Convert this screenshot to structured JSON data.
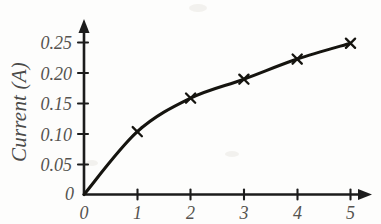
{
  "chart_data": {
    "type": "line",
    "title": "",
    "xlabel": "",
    "ylabel": "Current (A)",
    "x": [
      0,
      1,
      2,
      3,
      4,
      5
    ],
    "values": [
      0,
      0.103,
      0.158,
      0.189,
      0.222,
      0.248
    ],
    "series": [
      {
        "name": "Current",
        "values": [
          0,
          0.103,
          0.158,
          0.189,
          0.222,
          0.248
        ]
      }
    ],
    "xlim": [
      0,
      5.4
    ],
    "ylim": [
      0,
      0.27
    ],
    "xticks": [
      "0",
      "1",
      "2",
      "3",
      "4",
      "5"
    ],
    "yticks": [
      "0",
      "0.05",
      "0.10",
      "0.15",
      "0.20",
      "0.25"
    ],
    "ytick_values": [
      0,
      0.05,
      0.1,
      0.15,
      0.2,
      0.25
    ],
    "grid": false,
    "legend": false,
    "legend_position": "none",
    "marker": "x",
    "line_color": "#15140f",
    "axis_color": "#1c1c1c",
    "background_color": "#fdfdfc"
  },
  "axes": {
    "y_title": "Current (A)",
    "x_title": "",
    "origin_label": "0"
  },
  "ticks": {
    "y": [
      {
        "label": "0.25",
        "value": 0.25
      },
      {
        "label": "0.20",
        "value": 0.2
      },
      {
        "label": "0.15",
        "value": 0.15
      },
      {
        "label": "0.10",
        "value": 0.1
      },
      {
        "label": "0.05",
        "value": 0.05
      }
    ],
    "x": [
      {
        "label": "0",
        "value": 0
      },
      {
        "label": "1",
        "value": 1
      },
      {
        "label": "2",
        "value": 2
      },
      {
        "label": "3",
        "value": 3
      },
      {
        "label": "4",
        "value": 4
      },
      {
        "label": "5",
        "value": 5
      }
    ]
  }
}
